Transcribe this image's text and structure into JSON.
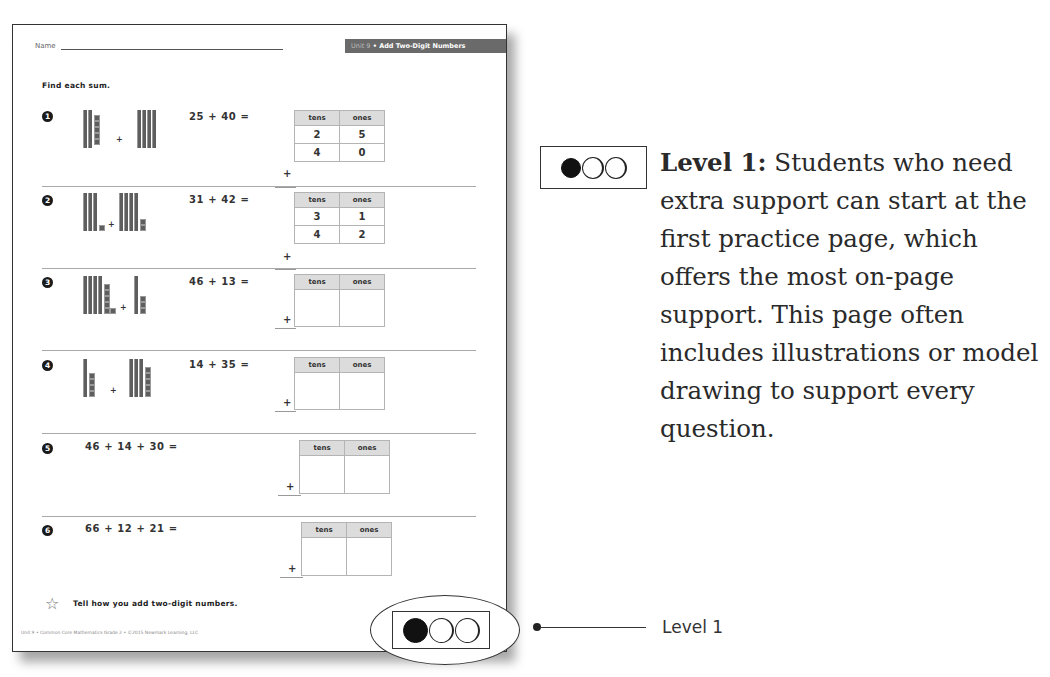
{
  "worksheet": {
    "name_label": "Name",
    "unit_prefix": "Unit 9",
    "unit_separator": " • ",
    "unit_title": "Add Two-Digit Numbers",
    "instruction": "Find each sum.",
    "table_headers": {
      "tens": "tens",
      "ones": "ones"
    },
    "plus_sign": "+",
    "problems": [
      {
        "number": "1",
        "equation": "25 + 40 =",
        "addend1": {
          "tens": "2",
          "ones": "5"
        },
        "addend2": {
          "tens": "4",
          "ones": "0"
        },
        "model": {
          "left_tens": 2,
          "left_ones": 5,
          "right_tens": 4,
          "right_ones": 0
        }
      },
      {
        "number": "2",
        "equation": "31 + 42 =",
        "addend1": {
          "tens": "3",
          "ones": "1"
        },
        "addend2": {
          "tens": "4",
          "ones": "2"
        },
        "model": {
          "left_tens": 3,
          "left_ones": 1,
          "right_tens": 4,
          "right_ones": 2
        }
      },
      {
        "number": "3",
        "equation": "46 + 13 =",
        "addend1": {
          "tens": "",
          "ones": ""
        },
        "addend2": {
          "tens": "",
          "ones": ""
        },
        "model": {
          "left_tens": 4,
          "left_ones": 6,
          "right_tens": 1,
          "right_ones": 3
        }
      },
      {
        "number": "4",
        "equation": "14 + 35 =",
        "addend1": {
          "tens": "",
          "ones": ""
        },
        "addend2": {
          "tens": "",
          "ones": ""
        },
        "model": {
          "left_tens": 1,
          "left_ones": 4,
          "right_tens": 3,
          "right_ones": 5
        }
      },
      {
        "number": "5",
        "equation": "46 + 14 + 30 ="
      },
      {
        "number": "6",
        "equation": "66 + 12 + 21 ="
      }
    ],
    "star_prompt": "Tell how you add two-digit numbers.",
    "footer": "Unit 9 • Common Core Mathematics Grade 2 • ©2015 Newmark Learning, LLC",
    "level_indicator": {
      "filled": 1,
      "total": 3
    }
  },
  "callout": {
    "label": "Level 1"
  },
  "description": {
    "level_title": "Level 1:",
    "text": " Students who need extra support can start at the first practice page, which offers the most on-page support. This page often includes illustrations or model drawing to support every question.",
    "level_indicator": {
      "filled": 1,
      "total": 3
    }
  },
  "colors": {
    "header_tab_bg": "#6a6a6a",
    "table_header_bg": "#dcdcdc",
    "border": "#333333",
    "block": "#5e5e5e"
  }
}
